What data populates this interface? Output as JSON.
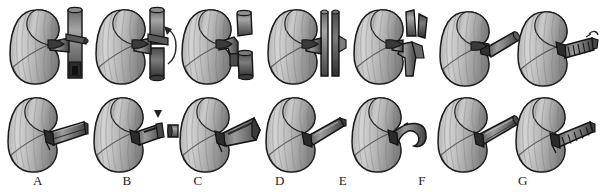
{
  "figure": {
    "type": "surgical-illustration-grid",
    "background_color": "#ffffff",
    "rows": 2,
    "columns": 7,
    "ink_color": "#1a1a1a",
    "organ_fill_light": "#d2d2d2",
    "organ_fill_mid": "#a8a8a8",
    "organ_fill_dark": "#6e6e6e",
    "vessel_fill_light": "#9a9a9a",
    "vessel_fill_dark": "#4a4a4a",
    "panel_labels": [
      "A",
      "B",
      "C",
      "D",
      "E",
      "F",
      "G"
    ],
    "panels": [
      {
        "label": "A",
        "top": {
          "name": "kidney-with-intact-great-vessel",
          "description": "Kidney attached by renal vein to an intact vertical great vessel (vena cava) with encircling ligature",
          "has_arrow": false,
          "arrow_kind": "none",
          "vessel_state": "intact-vertical-trunk",
          "clamp": true,
          "detached_piece": false
        },
        "bottom": {
          "name": "kidney-with-long-vessel-cuff",
          "description": "Kidney with long banded vessel cuff extending to the right",
          "has_arrow": false,
          "arrow_kind": "none",
          "vessel_state": "long-cuff",
          "clamp": true,
          "detached_piece": false
        }
      },
      {
        "label": "B",
        "top": {
          "name": "kidney-vessel-with-rotation-arrow",
          "description": "Kidney and vertical vessel with curved arrow indicating rotation of the vessel segment",
          "has_arrow": true,
          "arrow_kind": "curved",
          "vessel_state": "intact-vertical-trunk",
          "clamp": true,
          "detached_piece": false
        },
        "bottom": {
          "name": "kidney-with-excised-cuff-ring",
          "description": "Kidney with vessel cuff and a separated ring segment to the right, small triangular pointer above",
          "has_arrow": true,
          "arrow_kind": "triangle-pointer",
          "vessel_state": "cuff-with-excised-ring",
          "clamp": true,
          "detached_piece": true
        }
      },
      {
        "label": "C",
        "top": {
          "name": "kidney-with-divided-vessel-segments",
          "description": "Kidney with the great vessel divided into separated upper and lower cylindrical segments",
          "has_arrow": false,
          "arrow_kind": "none",
          "vessel_state": "divided-two-segments",
          "clamp": false,
          "detached_piece": true
        },
        "bottom": {
          "name": "kidney-with-wide-vessel-patch",
          "description": "Kidney with a broad tapering vessel patch extending to the right",
          "has_arrow": false,
          "arrow_kind": "none",
          "vessel_state": "wide-patch",
          "clamp": true,
          "detached_piece": false
        }
      },
      {
        "label": "D",
        "top": {
          "name": "kidney-with-longitudinally-incised-vessel",
          "description": "Kidney with vertical great vessel split longitudinally into two parallel halves",
          "has_arrow": false,
          "arrow_kind": "none",
          "vessel_state": "longitudinally-split-trunk",
          "clamp": false,
          "detached_piece": false
        },
        "bottom": {
          "name": "kidney-with-narrow-tubular-cuff",
          "description": "Kidney with a narrow tubular vessel cuff angled upward to the right",
          "has_arrow": false,
          "arrow_kind": "none",
          "vessel_state": "narrow-tube",
          "clamp": true,
          "detached_piece": false
        }
      },
      {
        "label": "E",
        "top": {
          "name": "kidney-with-opened-vessel-flaps",
          "description": "Kidney with the divided vessel opened into splayed upper and lower flaps",
          "has_arrow": false,
          "arrow_kind": "none",
          "vessel_state": "splayed-flaps",
          "clamp": false,
          "detached_piece": false
        },
        "bottom": {
          "name": "kidney-with-curved-vessel-stump",
          "description": "Kidney with a short curved hooked vessel stump",
          "has_arrow": false,
          "arrow_kind": "none",
          "vessel_state": "curved-hook-stump",
          "clamp": true,
          "detached_piece": false
        }
      },
      {
        "label": "F",
        "top": {
          "name": "kidney-with-short-oblique-vessel",
          "description": "Kidney with a short smooth oblique vessel cuff projecting upward to the right",
          "has_arrow": false,
          "arrow_kind": "none",
          "vessel_state": "short-oblique-cuff",
          "clamp": true,
          "detached_piece": false
        },
        "bottom": {
          "name": "kidney-with-smooth-elongated-vessel",
          "description": "Kidney with a smooth elongated vessel cuff angled upward to the right",
          "has_arrow": false,
          "arrow_kind": "none",
          "vessel_state": "smooth-elongated-cuff",
          "clamp": true,
          "detached_piece": false
        }
      },
      {
        "label": "G",
        "top": {
          "name": "kidney-with-stapled-vessel-stump",
          "description": "Kidney with a stapled and ligated vessel stump showing a row of staples and a knot",
          "has_arrow": false,
          "arrow_kind": "none",
          "vessel_state": "stapled-stump",
          "clamp": true,
          "detached_piece": false
        },
        "bottom": {
          "name": "kidney-with-ribbed-vessel-cuff",
          "description": "Kidney with a ribbed striped vessel cuff extending to the right",
          "has_arrow": false,
          "arrow_kind": "none",
          "vessel_state": "ribbed-cuff",
          "clamp": true,
          "detached_piece": false
        }
      }
    ]
  }
}
